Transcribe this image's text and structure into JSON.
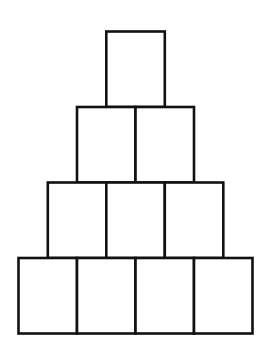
{
  "diagram": {
    "type": "block-pyramid",
    "rows": [
      {
        "row": 1,
        "box_count": 1
      },
      {
        "row": 2,
        "box_count": 2
      },
      {
        "row": 3,
        "box_count": 3
      },
      {
        "row": 4,
        "box_count": 4
      }
    ],
    "total_boxes": 10,
    "box_fill": "#ffffff",
    "stroke_color": "#111111",
    "labels": []
  }
}
